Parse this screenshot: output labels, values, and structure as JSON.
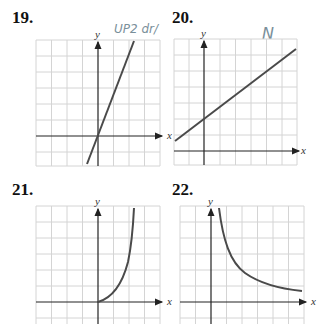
{
  "problems": [
    {
      "number": "19.",
      "annotation": "UP2 dr/",
      "curve": "line through origin, steep positive slope"
    },
    {
      "number": "20.",
      "annotation": "N",
      "curve": "line with positive y-intercept, moderate positive slope"
    },
    {
      "number": "21.",
      "annotation": "",
      "curve": "increasing convex curve starting at origin"
    },
    {
      "number": "22.",
      "annotation": "",
      "curve": "decreasing curve approaching x-axis (1/x shape)"
    }
  ],
  "axes": {
    "x_label": "x",
    "y_label": "y"
  },
  "colors": {
    "grid": "#d4d4d4",
    "axis": "#222222",
    "curve": "#4a4a4a",
    "annotation": "#7a8f9a"
  }
}
